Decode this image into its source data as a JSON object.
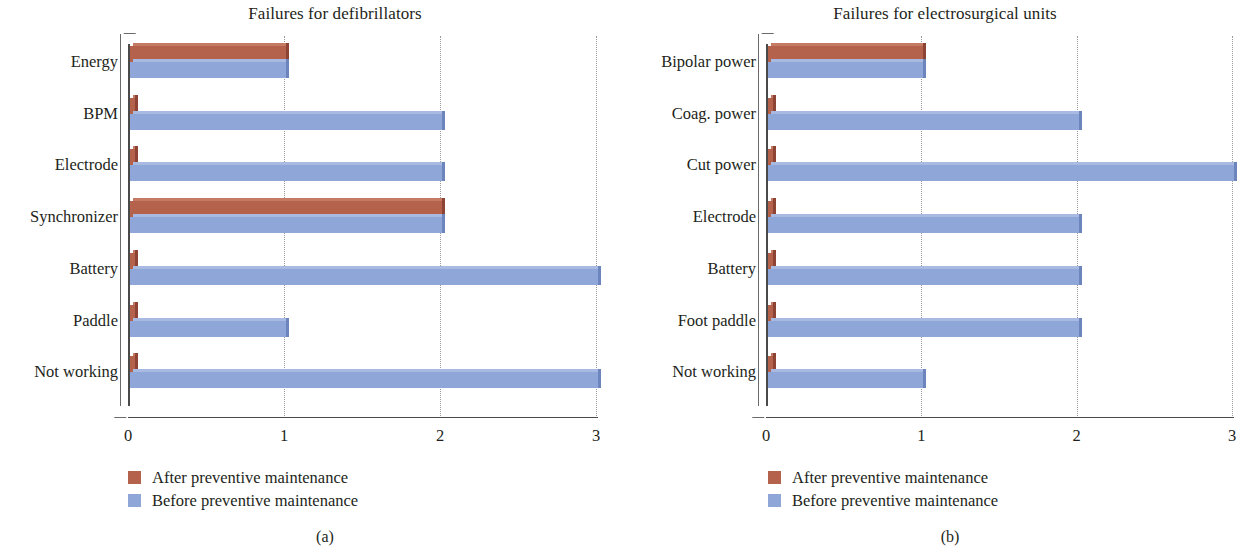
{
  "colors": {
    "after": "#b5624c",
    "after_top": "#c47a63",
    "after_side": "#8e4434",
    "before": "#8fa6d8",
    "before_top": "#a8bae2",
    "before_side": "#6d85bd",
    "axis": "#4a4a4a",
    "grid": "#9a9a9a",
    "text": "#231f20"
  },
  "legend": {
    "after_label": "After preventive maintenance",
    "before_label": "Before preventive maintenance"
  },
  "panels": [
    {
      "caption": "(a)"
    },
    {
      "caption": "(b)"
    }
  ],
  "chart_data": [
    {
      "type": "bar",
      "orientation": "horizontal",
      "title": "Failures for defibrillators",
      "caption": "(a)",
      "xlabel": "",
      "ylabel": "",
      "xlim": [
        0,
        3
      ],
      "xticks": [
        0,
        1,
        2,
        3
      ],
      "xtick_labels": [
        "0",
        "1",
        "2",
        "3"
      ],
      "grid": "vertical-dotted",
      "legend_position": "below-left",
      "categories": [
        "Energy",
        "BPM",
        "Electrode",
        "Synchronizer",
        "Battery",
        "Paddle",
        "Not working"
      ],
      "series": [
        {
          "name": "After preventive maintenance",
          "color": "#b5624c",
          "values": [
            1,
            0.03,
            0.03,
            2,
            0.03,
            0.03,
            0.03
          ]
        },
        {
          "name": "Before preventive maintenance",
          "color": "#8fa6d8",
          "values": [
            1,
            2,
            2,
            2,
            3,
            1,
            3
          ]
        }
      ]
    },
    {
      "type": "bar",
      "orientation": "horizontal",
      "title": "Failures for electrosurgical units",
      "caption": "(b)",
      "xlabel": "",
      "ylabel": "",
      "xlim": [
        0,
        3
      ],
      "xticks": [
        0,
        1,
        2,
        3
      ],
      "xtick_labels": [
        "0",
        "1",
        "2",
        "3"
      ],
      "grid": "vertical-dotted",
      "legend_position": "below-left",
      "categories": [
        "Bipolar power",
        "Coag. power",
        "Cut power",
        "Electrode",
        "Battery",
        "Foot paddle",
        "Not working"
      ],
      "series": [
        {
          "name": "After preventive maintenance",
          "color": "#b5624c",
          "values": [
            1,
            0.03,
            0.03,
            0.03,
            0.03,
            0.03,
            0.03
          ]
        },
        {
          "name": "Before preventive maintenance",
          "color": "#8fa6d8",
          "values": [
            1,
            2,
            3,
            2,
            2,
            2,
            1
          ]
        }
      ]
    }
  ]
}
